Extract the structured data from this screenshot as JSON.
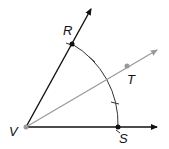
{
  "diagram": {
    "points": {
      "V": {
        "label": "V",
        "x": 26,
        "y": 127
      },
      "R": {
        "label": "R",
        "x": 72,
        "y": 44
      },
      "S": {
        "label": "S",
        "x": 118,
        "y": 127
      },
      "T": {
        "label": "T",
        "x": 127,
        "y": 66
      }
    },
    "rays": [
      {
        "from": "V",
        "through": "R",
        "color": "#111111"
      },
      {
        "from": "V",
        "through": "S",
        "color": "#111111"
      },
      {
        "from": "V",
        "through": "T",
        "color": "#999999"
      }
    ],
    "arc": {
      "center": "V",
      "from": "R",
      "to": "S",
      "tick_marks": 2
    },
    "colors": {
      "main": "#111111",
      "bisector": "#999999"
    }
  }
}
